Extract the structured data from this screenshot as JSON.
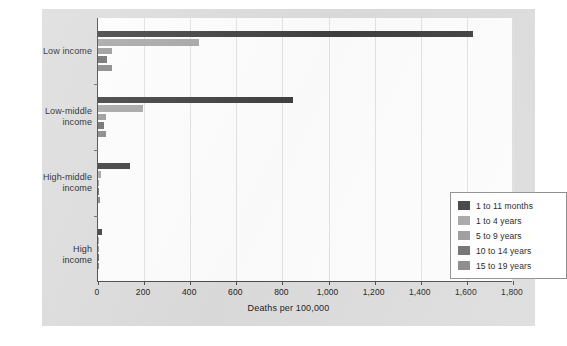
{
  "figure": {
    "xaxis_title": "Deaths per 100,000"
  },
  "legend": {
    "entries": [
      {
        "label": "1 to 11 months",
        "color": "#3f3f3f"
      },
      {
        "label": "1 to 4 years",
        "color": "#a6a6a6"
      },
      {
        "label": "5 to 9 years",
        "color": "#9a9a9a"
      },
      {
        "label": "10 to 14 years",
        "color": "#6e6e6e"
      },
      {
        "label": "15 to 19 years",
        "color": "#878787"
      }
    ]
  },
  "axis": {
    "x_ticks": [
      "0",
      "200",
      "400",
      "600",
      "800",
      "1,000",
      "1,200",
      "1,400",
      "1,600",
      "1,800"
    ],
    "y_categories": [
      "Low income",
      "Low-middle\nincome",
      "High-middle\nincome",
      "High income"
    ]
  },
  "chart_data": {
    "type": "bar",
    "orientation": "horizontal",
    "title": "",
    "xlabel": "Deaths per 100,000",
    "ylabel": "",
    "xlim": [
      0,
      1800
    ],
    "xticks": [
      0,
      200,
      400,
      600,
      800,
      1000,
      1200,
      1400,
      1600,
      1800
    ],
    "grid": "vertical",
    "legend_position": "lower-right inside plot",
    "categories": [
      "Low income",
      "Low-middle income",
      "High-middle income",
      "High income"
    ],
    "series": [
      {
        "name": "1 to 11 months",
        "color": "#3f3f3f",
        "values": [
          1625,
          845,
          140,
          18
        ]
      },
      {
        "name": "1 to 4 years",
        "color": "#a6a6a6",
        "values": [
          440,
          195,
          13,
          5
        ]
      },
      {
        "name": "5 to 9 years",
        "color": "#9a9a9a",
        "values": [
          60,
          35,
          5,
          3
        ]
      },
      {
        "name": "10 to 14 years",
        "color": "#6e6e6e",
        "values": [
          38,
          25,
          5,
          3
        ]
      },
      {
        "name": "15 to 19 years",
        "color": "#878787",
        "values": [
          62,
          33,
          7,
          5
        ]
      }
    ]
  }
}
